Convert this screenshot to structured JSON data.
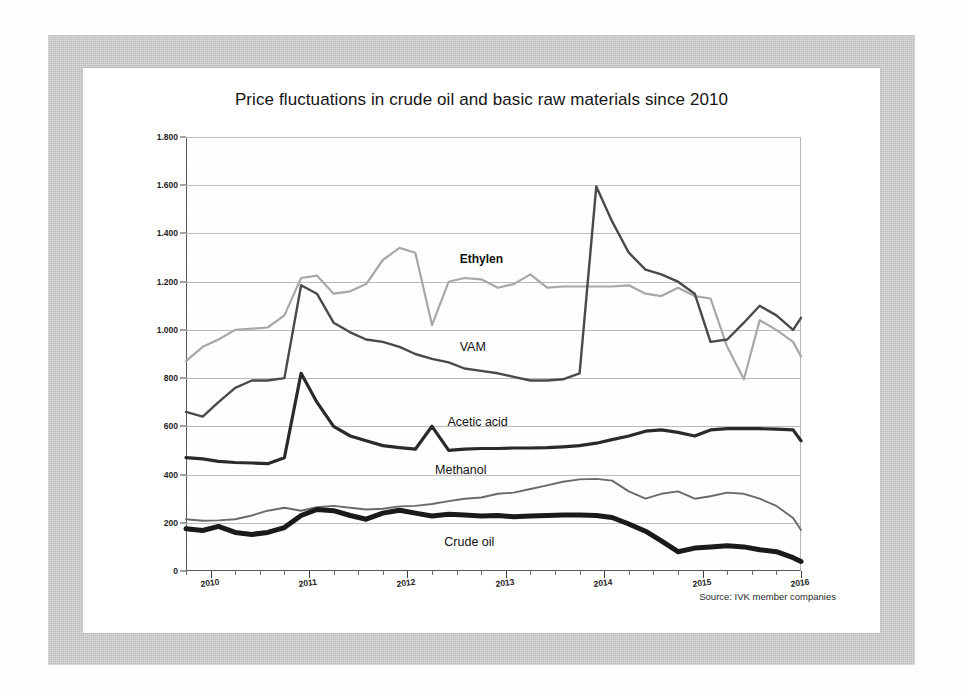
{
  "page": {
    "source_note": "Source: IVK member companies"
  },
  "chart_data": {
    "type": "line",
    "title": "Price fluctuations in crude oil and basic raw materials since 2010",
    "xlabel": "",
    "ylabel": "",
    "ylim": [
      0,
      1800
    ],
    "xlim": [
      2009.75,
      2016.0
    ],
    "grid": true,
    "legend": "inline-labels",
    "ytick_labels": [
      "0",
      "200",
      "400",
      "600",
      "800",
      "1.000",
      "1.200",
      "1.400",
      "1.600",
      "1.800"
    ],
    "ytick_values": [
      0,
      200,
      400,
      600,
      800,
      1000,
      1200,
      1400,
      1600,
      1800
    ],
    "xtick_labels": [
      "2010",
      "2011",
      "2012",
      "2013",
      "2014",
      "2015",
      "2016"
    ],
    "xtick_values": [
      2010,
      2011,
      2012,
      2013,
      2014,
      2015,
      2016
    ],
    "x_minor_tick_interval_months": 3,
    "x": [
      2009.75,
      2009.92,
      2010.08,
      2010.25,
      2010.42,
      2010.58,
      2010.75,
      2010.92,
      2011.08,
      2011.25,
      2011.42,
      2011.58,
      2011.75,
      2011.92,
      2012.08,
      2012.25,
      2012.42,
      2012.58,
      2012.75,
      2012.92,
      2013.08,
      2013.25,
      2013.42,
      2013.58,
      2013.75,
      2013.92,
      2014.08,
      2014.25,
      2014.42,
      2014.58,
      2014.75,
      2014.92,
      2015.08,
      2015.25,
      2015.42,
      2015.58,
      2015.75,
      2015.92,
      2016.0
    ],
    "series": [
      {
        "name": "Ethylen",
        "color": "#a8a8a8",
        "width": 2.2,
        "label_position": "above-curve",
        "values": [
          870,
          930,
          960,
          1000,
          1005,
          1010,
          1060,
          1215,
          1225,
          1150,
          1160,
          1190,
          1290,
          1340,
          1320,
          1020,
          1200,
          1215,
          1210,
          1175,
          1190,
          1230,
          1175,
          1180,
          1180,
          1180,
          1180,
          1185,
          1150,
          1140,
          1175,
          1140,
          1130,
          930,
          795,
          1040,
          1000,
          950,
          890
        ]
      },
      {
        "name": "VAM",
        "color": "#4a4a4a",
        "width": 2.4,
        "label_position": "above-curve",
        "values": [
          660,
          640,
          700,
          760,
          790,
          790,
          800,
          1185,
          1150,
          1030,
          990,
          960,
          950,
          930,
          900,
          880,
          865,
          840,
          830,
          820,
          805,
          790,
          790,
          795,
          820,
          1595,
          1450,
          1320,
          1250,
          1230,
          1200,
          1150,
          950,
          960,
          1030,
          1100,
          1060,
          1000,
          1050
        ]
      },
      {
        "name": "Acetic acid",
        "color": "#2a2a2a",
        "width": 3.2,
        "label_position": "above-curve",
        "values": [
          470,
          465,
          455,
          450,
          448,
          445,
          470,
          820,
          700,
          600,
          560,
          540,
          520,
          512,
          505,
          600,
          500,
          505,
          508,
          508,
          510,
          510,
          512,
          515,
          520,
          530,
          545,
          560,
          580,
          585,
          575,
          560,
          585,
          590,
          590,
          590,
          588,
          585,
          540
        ]
      },
      {
        "name": "Methanol",
        "color": "#6a6a6a",
        "width": 1.9,
        "label_position": "above-curve",
        "values": [
          215,
          208,
          210,
          215,
          230,
          250,
          262,
          250,
          265,
          270,
          262,
          255,
          258,
          268,
          270,
          278,
          290,
          300,
          305,
          320,
          325,
          340,
          355,
          370,
          380,
          382,
          375,
          330,
          300,
          320,
          330,
          300,
          310,
          325,
          320,
          300,
          270,
          220,
          170
        ]
      },
      {
        "name": "Crude oil",
        "color": "#1a1a1a",
        "width": 5.0,
        "label_position": "below-curve",
        "values": [
          175,
          168,
          185,
          160,
          152,
          160,
          180,
          230,
          255,
          250,
          230,
          215,
          240,
          252,
          240,
          228,
          235,
          232,
          228,
          230,
          225,
          228,
          230,
          232,
          232,
          230,
          222,
          195,
          165,
          125,
          80,
          95,
          100,
          105,
          100,
          88,
          80,
          55,
          40
        ]
      }
    ],
    "annotations": [
      {
        "text": "Ethylen",
        "x_frac": 0.445,
        "y_value": 1290
      },
      {
        "text": "VAM",
        "x_frac": 0.445,
        "y_value": 925
      },
      {
        "text": "Acetic acid",
        "x_frac": 0.425,
        "y_value": 615
      },
      {
        "text": "Methanol",
        "x_frac": 0.405,
        "y_value": 415
      },
      {
        "text": "Crude oil",
        "x_frac": 0.42,
        "y_value": 118
      }
    ]
  }
}
